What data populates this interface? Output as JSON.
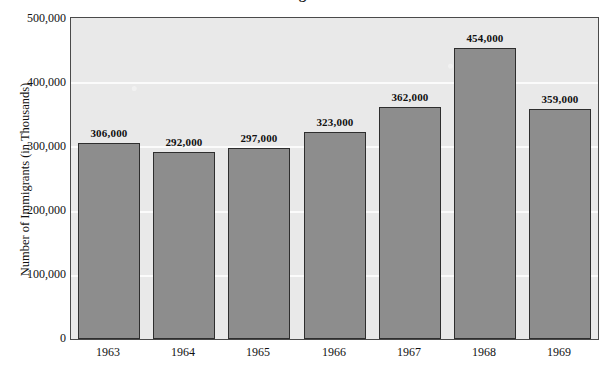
{
  "chart_data": {
    "type": "bar",
    "title": "",
    "xlabel": "",
    "ylabel": "Number of Immigrants (in Thousands)",
    "categories": [
      "1963",
      "1964",
      "1965",
      "1966",
      "1967",
      "1968",
      "1969"
    ],
    "values": [
      306000,
      292000,
      297000,
      323000,
      362000,
      454000,
      359000
    ],
    "data_labels": [
      "306,000",
      "292,000",
      "297,000",
      "323,000",
      "362,000",
      "454,000",
      "359,000"
    ],
    "ylim": [
      0,
      500000
    ],
    "ytick_values": [
      0,
      100000,
      200000,
      300000,
      400000,
      500000
    ],
    "ytick_labels": [
      "0",
      "100,000",
      "200,000",
      "300,000",
      "400,000",
      "500,000"
    ],
    "gridlines": [
      "100,000",
      "200,000",
      "300,000",
      "400,000"
    ],
    "grid": true,
    "legend": "none",
    "colors": {
      "bar_fill": "#8d8d8d",
      "bar_edge": "#2e2e2e",
      "plot_background": "#e9e9e9",
      "gridline": "#fbfbfb",
      "axis": "#4a4a4a",
      "text": "#111111"
    }
  },
  "figure": {
    "title_fragment": "Immigration"
  }
}
